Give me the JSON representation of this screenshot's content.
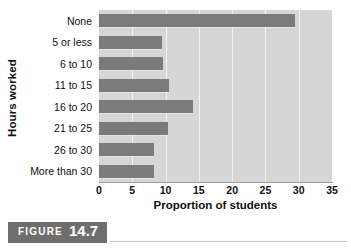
{
  "chart_data": {
    "type": "bar",
    "orientation": "horizontal",
    "title": "",
    "xlabel": "Proportion of students",
    "ylabel": "Hours worked",
    "categories": [
      "None",
      "5 or less",
      "6 to 10",
      "11 to 15",
      "16 to 20",
      "21 to 25",
      "26 to 30",
      "More than 30"
    ],
    "values": [
      29.5,
      9.5,
      9.6,
      10.5,
      14.1,
      10.4,
      8.2,
      8.2
    ],
    "xlim": [
      0,
      35
    ],
    "xticks": [
      0,
      5,
      10,
      15,
      20,
      25,
      30,
      35
    ],
    "xtick_labels": [
      "0",
      "5",
      "10",
      "15",
      "20",
      "25",
      "30",
      "35"
    ],
    "grid": "vertical",
    "legend": "none",
    "series": [
      {
        "name": "Proportion of students",
        "values": [
          29.5,
          9.5,
          9.6,
          10.5,
          14.1,
          10.4,
          8.2,
          8.2
        ]
      }
    ],
    "colors": {
      "bar": "#7b7b7b",
      "plot_background": "#d6d6d6",
      "gridline": "#f2f2f2",
      "axis_line": "#9a9a9a",
      "text": "#111111"
    }
  },
  "caption": {
    "word": "FIGURE",
    "number": "14.7",
    "banner_color": "#6e6e6e"
  }
}
